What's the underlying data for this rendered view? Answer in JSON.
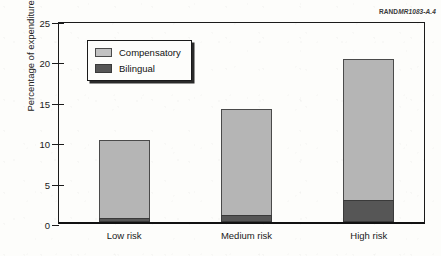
{
  "corner_id": {
    "brand": "RAND",
    "rest": "MR1083-A.4"
  },
  "chart_data": {
    "type": "bar",
    "subtype": "stacked-vertical",
    "title": "",
    "xlabel": "",
    "ylabel": "Percentage of expenditures",
    "categories": [
      "Low risk",
      "Medium risk",
      "High risk"
    ],
    "ylim": [
      0,
      25
    ],
    "yticks": [
      0,
      5,
      10,
      15,
      20,
      25
    ],
    "ytick_labels": [
      "0",
      "5",
      "10",
      "15",
      "20",
      "25"
    ],
    "grid": false,
    "legend_position": "upper-left-inside",
    "series": [
      {
        "name": "Bilingual",
        "color": "#565656",
        "values": [
          0.5,
          0.9,
          2.7
        ]
      },
      {
        "name": "Compensatory",
        "color": "#b5b5b5",
        "values": [
          9.7,
          13.1,
          17.5
        ]
      }
    ],
    "totals": [
      10.2,
      14.0,
      20.2
    ],
    "stack_order": [
      "Bilingual",
      "Compensatory"
    ]
  },
  "legend": {
    "items": [
      {
        "label": "Compensatory",
        "swatch": "light-gray-swatch"
      },
      {
        "label": "Bilingual",
        "swatch": "dark-gray-swatch"
      }
    ]
  },
  "colors": {
    "compensatory": "#b5b5b5",
    "bilingual": "#565656",
    "axis": "#1a1a1a",
    "background": "#fdfdfb"
  }
}
